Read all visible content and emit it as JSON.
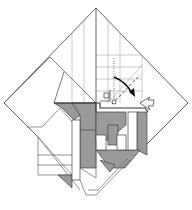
{
  "diagram": {
    "type": "origami-folding-step",
    "colors": {
      "background": "#ffffff",
      "line": "#555555",
      "thin_line": "#999999",
      "fill_gray": "#9a9a9a",
      "fill_white": "#ffffff",
      "arrow": "#111111"
    },
    "outline": {
      "top": [
        96,
        8
      ],
      "left": [
        4,
        103
      ],
      "right": [
        188,
        103
      ],
      "bottom": [
        96,
        195
      ]
    },
    "annotations": [
      {
        "kind": "valley-fold-line",
        "style": "dashed"
      },
      {
        "kind": "mountain-fold-line",
        "style": "dotted"
      },
      {
        "kind": "fold-arrow",
        "direction": "down-right"
      },
      {
        "kind": "pivot-circle"
      },
      {
        "kind": "right-angle-marker"
      },
      {
        "kind": "open-flap-arrow"
      }
    ]
  }
}
